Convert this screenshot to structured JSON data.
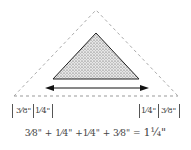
{
  "diagram": {
    "colors": {
      "outline": "#222222",
      "dashed": "#aaaaaa",
      "fill_dots": "#555555",
      "text": "#444444"
    },
    "outer_triangle": {
      "style": "dashed",
      "apex": [
        96,
        10
      ],
      "base_left": [
        14,
        96
      ],
      "base_right": [
        178,
        96
      ]
    },
    "inner_triangle": {
      "style": "solid-stippled",
      "apex": [
        96,
        33
      ],
      "base_left": [
        53,
        79
      ],
      "base_right": [
        139,
        79
      ]
    },
    "arrow": {
      "type": "double-headed",
      "y": 88,
      "x1": 45,
      "x2": 149
    },
    "left_labels": [
      "3⁄8\"",
      "1⁄4\""
    ],
    "right_labels": [
      "1⁄4\"",
      "3⁄8\""
    ],
    "equation": {
      "terms": [
        "3⁄8\"",
        "+",
        "1⁄4\"",
        "+",
        "1⁄4\"",
        "+",
        "3⁄8\"",
        "="
      ],
      "result": "1¼\"",
      "text": "3⁄8\" + 1⁄4\" +1⁄4\" + 3⁄8\" ="
    }
  }
}
